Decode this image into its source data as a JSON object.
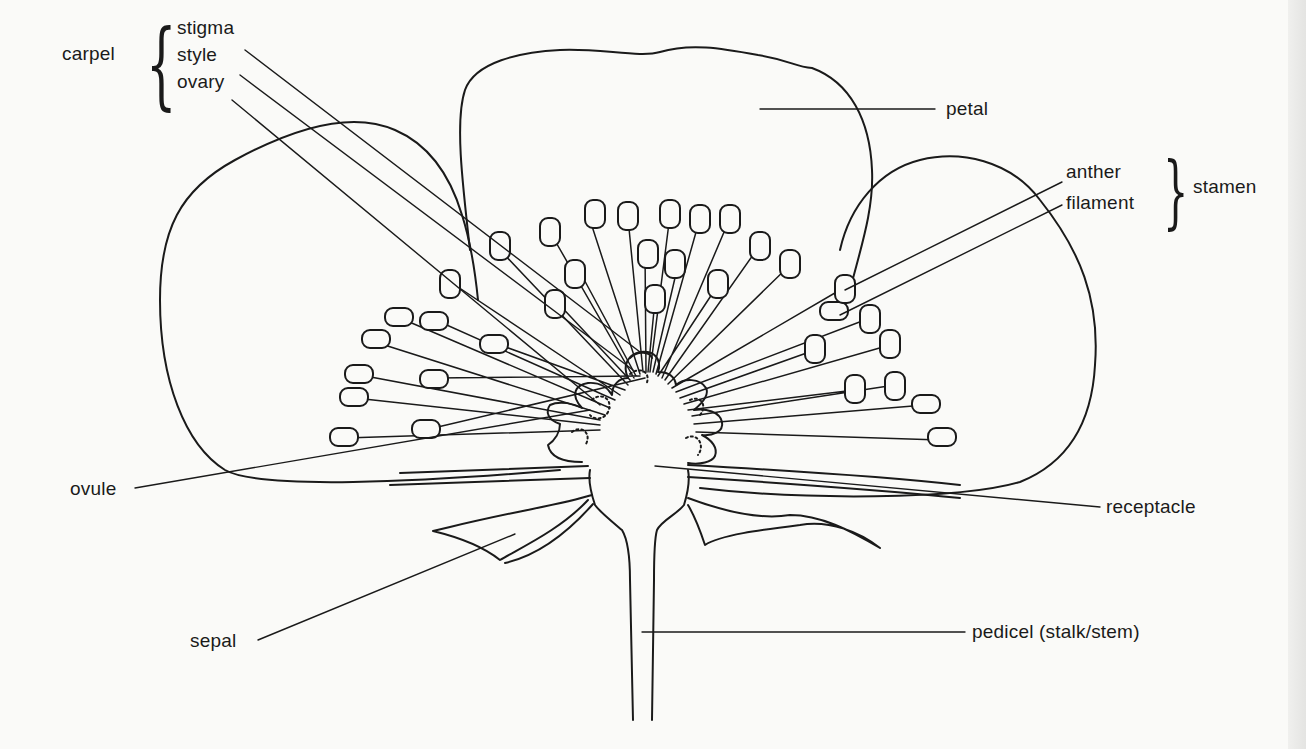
{
  "diagram": {
    "groups": [
      {
        "name": "carpel",
        "parts": [
          "stigma",
          "style",
          "ovary"
        ]
      },
      {
        "name": "stamen",
        "parts": [
          "anther",
          "filament"
        ]
      }
    ],
    "labels": {
      "carpel": "carpel",
      "stigma": "stigma",
      "style": "style",
      "ovary": "ovary",
      "petal": "petal",
      "anther": "anther",
      "filament": "filament",
      "stamen": "stamen",
      "ovule": "ovule",
      "receptacle": "receptacle",
      "sepal": "sepal",
      "pedicel": "pedicel (stalk/stem)"
    },
    "colors": {
      "line": "#1a1a1a",
      "background": "#fafaf8"
    }
  }
}
